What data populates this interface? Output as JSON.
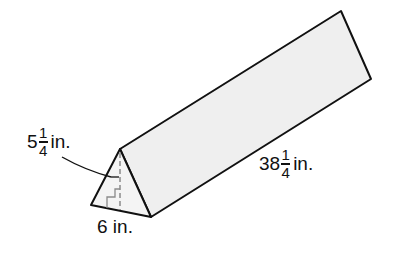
{
  "figure": {
    "type": "triangular-prism",
    "colors": {
      "face_fill": "#efefef",
      "front_fill": "#f4f4f4",
      "stroke": "#111111",
      "height_line": "#8a8a8a"
    }
  },
  "labels": {
    "height": {
      "whole": "5",
      "numerator": "1",
      "denominator": "4",
      "unit": "in."
    },
    "base": {
      "text": "6 in."
    },
    "length": {
      "whole": "38",
      "numerator": "1",
      "denominator": "4",
      "unit": "in."
    }
  }
}
